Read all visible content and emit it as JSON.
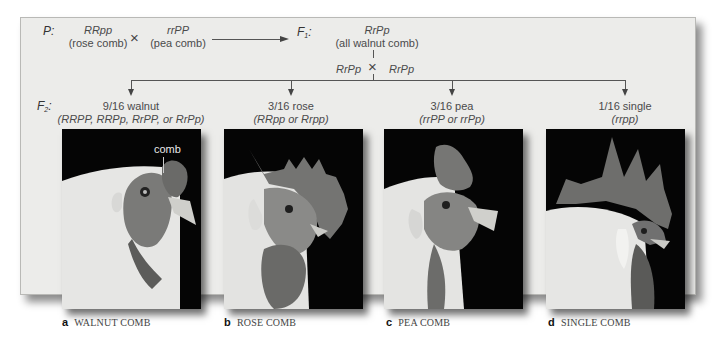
{
  "figure": {
    "parental": {
      "label": "P",
      "colon": ":",
      "parent1": {
        "genotype": "RRpp",
        "phenotype": "(rose comb)"
      },
      "cross_symbol": "×",
      "parent2": {
        "genotype": "rrPP",
        "phenotype": "(pea comb)"
      }
    },
    "f1": {
      "label": "F",
      "subscript": "1",
      "colon": ":",
      "genotype": "RrPp",
      "phenotype": "(all walnut comb)",
      "selfcross": {
        "left": "RrPp",
        "symbol": "×",
        "right": "RrPp"
      }
    },
    "f2": {
      "label": "F",
      "subscript": "2",
      "colon": ":",
      "classes": [
        {
          "ratio": "9/16 walnut",
          "genotypes": "(RRPP, RRPp, RrPP, or RrPp)"
        },
        {
          "ratio": "3/16 rose",
          "genotypes": "(RRpp or Rrpp)"
        },
        {
          "ratio": "3/16 pea",
          "genotypes": "(rrPP or rrPp)"
        },
        {
          "ratio": "1/16 single",
          "genotypes": "(rrpp)"
        }
      ]
    },
    "photo_annotation": "comb",
    "panels": [
      {
        "letter": "a",
        "title": "WALNUT COMB",
        "icon": "walnut-comb-chicken-photo"
      },
      {
        "letter": "b",
        "title": "ROSE COMB",
        "icon": "rose-comb-chicken-photo"
      },
      {
        "letter": "c",
        "title": "PEA COMB",
        "icon": "pea-comb-chicken-photo"
      },
      {
        "letter": "d",
        "title": "SINGLE COMB",
        "icon": "single-comb-rooster-photo"
      }
    ]
  }
}
